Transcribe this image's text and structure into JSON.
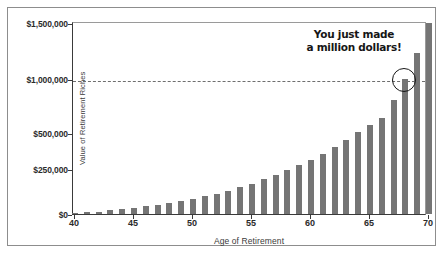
{
  "chart_data": {
    "type": "bar",
    "title": "",
    "xlabel": "Age of Retirement",
    "ylabel": "Value of Retirement Riches",
    "xlim": [
      40,
      70
    ],
    "ylim": [
      0,
      1500000
    ],
    "grid": false,
    "legend": null,
    "bar_color": "#757575",
    "x": [
      40,
      41,
      42,
      43,
      44,
      45,
      46,
      47,
      48,
      49,
      50,
      51,
      52,
      53,
      54,
      55,
      56,
      57,
      58,
      59,
      60,
      61,
      62,
      63,
      64,
      65,
      66,
      67,
      68,
      69,
      70
    ],
    "values": [
      4000,
      9000,
      14000,
      20000,
      27000,
      34000,
      42000,
      51000,
      61000,
      72000,
      84000,
      98000,
      113000,
      130000,
      149000,
      170000,
      193000,
      219000,
      248000,
      280000,
      316000,
      356000,
      401000,
      451000,
      507000,
      570000,
      641000,
      800000,
      1000000,
      1230000,
      1500000
    ],
    "xticks": [
      40,
      45,
      50,
      55,
      60,
      65,
      70
    ],
    "xtick_labels": [
      "40",
      "45",
      "50",
      "55",
      "60",
      "65",
      "70"
    ],
    "yticks": [
      0,
      250000,
      500000,
      1000000,
      1500000
    ],
    "ytick_labels": [
      "$0",
      "$250,000",
      "$500,000",
      "$1,000,000",
      "$1,500,000"
    ],
    "ytick_positions_frac": [
      0.0,
      0.232,
      0.42,
      0.702,
      0.99
    ],
    "reference_line": {
      "value": 1000000,
      "style": "dashed",
      "color": "#6e6e6e"
    },
    "annotation": {
      "line1": "You just made",
      "line2": "a million dollars!",
      "highlight_x": 68,
      "highlight_shape": "circle"
    }
  }
}
